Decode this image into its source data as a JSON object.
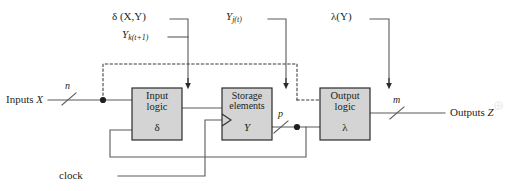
{
  "diagram": {
    "type": "block-diagram",
    "colors": {
      "line": "#5a5a5a",
      "box_fill": "#d4d4d4",
      "box_stroke": "#2b2b2b",
      "text": "#231f20",
      "dashed": "#3a3a3a",
      "background": "#ffffff"
    },
    "top_labels": [
      {
        "name": "delta-function-label",
        "text_main": "δ (X,Y)"
      },
      {
        "name": "next-state-label",
        "text_base": "Y",
        "text_sub": "k(t+1)"
      },
      {
        "name": "present-state-label",
        "text_base": "Y",
        "text_sub": "j(t)"
      },
      {
        "name": "lambda-function-label",
        "text_main": "λ(Y)"
      }
    ],
    "blocks": [
      {
        "name": "input-logic-block",
        "line1": "Input",
        "line2": "logic",
        "symbol": "δ"
      },
      {
        "name": "storage-elements-block",
        "line1": "Storage",
        "line2": "elements",
        "symbol": "Y"
      },
      {
        "name": "output-logic-block",
        "line1": "Output",
        "line2": "logic",
        "symbol": "λ"
      }
    ],
    "io": {
      "inputs_label": "Inputs ",
      "inputs_var": "X",
      "inputs_width": "n",
      "outputs_label": "Outputs ",
      "outputs_var": "Z",
      "outputs_width": "m",
      "state_width": "p",
      "clock_label": "clock"
    },
    "artifact_mark": "⨁"
  }
}
